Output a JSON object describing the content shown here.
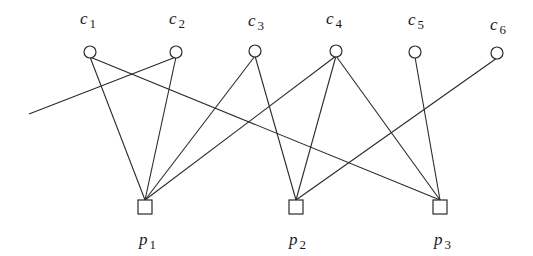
{
  "diagram": {
    "type": "bipartite-graph",
    "c_nodes": [
      {
        "id": "c1",
        "base": "c",
        "sub": "1",
        "x": 90,
        "y": 52,
        "label_x": 80,
        "label_y": 24
      },
      {
        "id": "c2",
        "base": "c",
        "sub": "2",
        "x": 176,
        "y": 52,
        "label_x": 169,
        "label_y": 24
      },
      {
        "id": "c3",
        "base": "c",
        "sub": "3",
        "x": 255,
        "y": 51,
        "label_x": 248,
        "label_y": 26
      },
      {
        "id": "c4",
        "base": "c",
        "sub": "4",
        "x": 336,
        "y": 51,
        "label_x": 326,
        "label_y": 24
      },
      {
        "id": "c5",
        "base": "c",
        "sub": "5",
        "x": 415,
        "y": 52,
        "label_x": 408,
        "label_y": 25
      },
      {
        "id": "c6",
        "base": "c",
        "sub": "6",
        "x": 497,
        "y": 53,
        "label_x": 490,
        "label_y": 30
      }
    ],
    "p_nodes": [
      {
        "id": "p1",
        "base": "p",
        "sub": "1",
        "x": 145,
        "y": 207,
        "label_x": 139,
        "label_y": 245
      },
      {
        "id": "p2",
        "base": "p",
        "sub": "2",
        "x": 296,
        "y": 207,
        "label_x": 289,
        "label_y": 245
      },
      {
        "id": "p3",
        "base": "p",
        "sub": "3",
        "x": 440,
        "y": 207,
        "label_x": 434,
        "label_y": 245
      }
    ],
    "edges": [
      {
        "from": "c1",
        "to": "p1"
      },
      {
        "from": "c1",
        "to": "p3"
      },
      {
        "from": "c2",
        "to": "p1"
      },
      {
        "from": "c2",
        "to": "external-left"
      },
      {
        "from": "c3",
        "to": "p1"
      },
      {
        "from": "c3",
        "to": "p2"
      },
      {
        "from": "c4",
        "to": "p1"
      },
      {
        "from": "c4",
        "to": "p2"
      },
      {
        "from": "c4",
        "to": "p3"
      },
      {
        "from": "c5",
        "to": "p3"
      },
      {
        "from": "c6",
        "to": "p2"
      }
    ],
    "external_points": {
      "external-left": {
        "x": 29,
        "y": 114
      }
    },
    "colors": {
      "stroke": "#2a2a2a",
      "background": "#ffffff"
    }
  }
}
